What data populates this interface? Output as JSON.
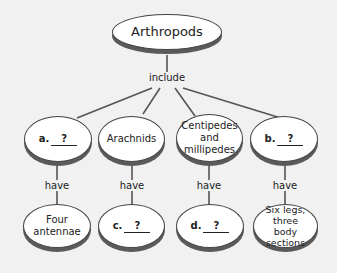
{
  "diagram": {
    "root": {
      "label": "Arthropods"
    },
    "root_link": "include",
    "groups": [
      {
        "id": "a",
        "letter": "a.",
        "blank": "?",
        "is_blank": true
      },
      {
        "id": "arachnids",
        "label": "Arachnids",
        "is_blank": false
      },
      {
        "id": "centipedes",
        "label": "Centipedes and millipedes",
        "is_blank": false
      },
      {
        "id": "b",
        "letter": "b.",
        "blank": "?",
        "is_blank": true
      }
    ],
    "child_link": "have",
    "traits": [
      {
        "id": "four-antennae",
        "label": "Four antennae",
        "is_blank": false
      },
      {
        "id": "c",
        "letter": "c.",
        "blank": "?",
        "is_blank": true
      },
      {
        "id": "d",
        "letter": "d.",
        "blank": "?",
        "is_blank": true
      },
      {
        "id": "six-legs",
        "label": "Six legs, three body sections",
        "is_blank": false
      }
    ],
    "colors": {
      "background": "#f1f1f1",
      "node_fill": "#ffffff",
      "node_shadow": "#5a5a5a",
      "line": "#555555",
      "text": "#222222"
    }
  }
}
